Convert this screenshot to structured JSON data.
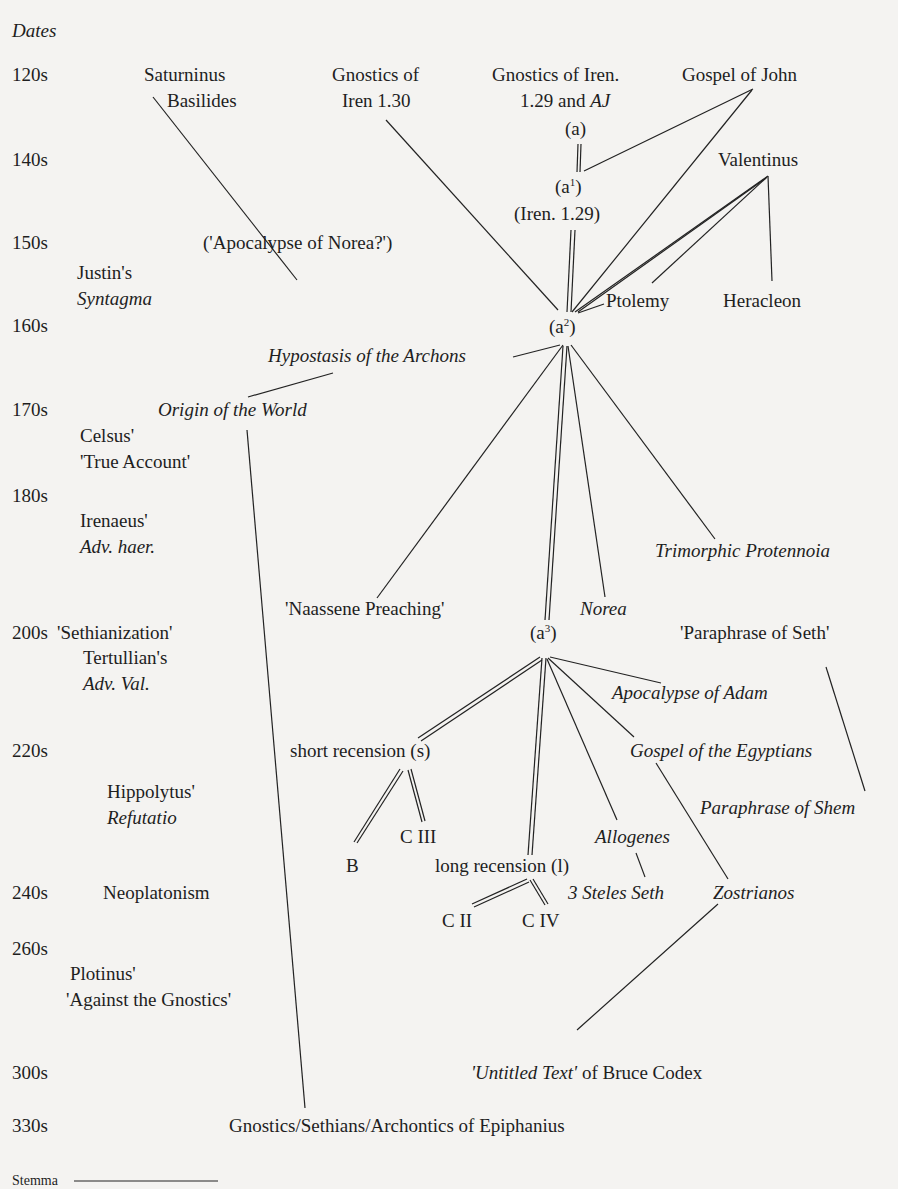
{
  "header": {
    "dates_label": "Dates"
  },
  "dates": [
    "120s",
    "140s",
    "150s",
    "160s",
    "170s",
    "180s",
    "200s",
    "220s",
    "240s",
    "260s",
    "300s",
    "330s"
  ],
  "context": {
    "justin_1": "Justin's",
    "justin_2": "Syntagma",
    "celsus_1": "Celsus'",
    "celsus_2": "'True Account'",
    "irenaeus_1": "Irenaeus'",
    "irenaeus_2": "Adv. haer.",
    "sethianization": "'Sethianization'",
    "tertullian_1": "Tertullian's",
    "tertullian_2": "Adv. Val.",
    "hippolytus_1": "Hippolytus'",
    "hippolytus_2": "Refutatio",
    "neoplatonism": "Neoplatonism",
    "plotinus_1": "Plotinus'",
    "plotinus_2": "'Against the Gnostics'"
  },
  "nodes": {
    "saturninus": "Saturninus",
    "basilides": "Basilides",
    "gnostics_130_1": "Gnostics of",
    "gnostics_130_2": "Iren 1.30",
    "gnostics_129_1": "Gnostics of Iren.",
    "gnostics_129_2": "1.29 and",
    "gnostics_129_aj": "AJ",
    "gospel_john": "Gospel of John",
    "a": "(a)",
    "a1_base": "(a",
    "a1_sup": "1",
    "a1_close": ")",
    "iren129": "(Iren. 1.29)",
    "valentinus": "Valentinus",
    "apoc_norea": "('Apocalypse of Norea?')",
    "ptolemy": "Ptolemy",
    "heracleon": "Heracleon",
    "a2_base": "(a",
    "a2_sup": "2",
    "a2_close": ")",
    "hypostasis": "Hypostasis of the Archons",
    "origin_world": "Origin of the World",
    "trimorphic": "Trimorphic Protennoia",
    "naassene": "'Naassene Preaching'",
    "norea": "Norea",
    "a3_base": "(a",
    "a3_sup": "3",
    "a3_close": ")",
    "paraphrase_seth": "'Paraphrase of Seth'",
    "apoc_adam": "Apocalypse of Adam",
    "short_recension": "short recension (s)",
    "gospel_egyptians": "Gospel of the Egyptians",
    "paraphrase_shem": "Paraphrase of Shem",
    "c3": "C III",
    "b": "B",
    "allogenes": "Allogenes",
    "long_recension": "long recension (l)",
    "three_steles": "3 Steles Seth",
    "zostrianos": "Zostrianos",
    "c2": "C II",
    "c4": "C IV",
    "untitled_it": "'Untitled Text'",
    "untitled_rest": " of Bruce Codex",
    "epiphanius": "Gnostics/Sethians/Archontics of Epiphanius"
  },
  "legend": {
    "stemma_label": "Stemma"
  }
}
